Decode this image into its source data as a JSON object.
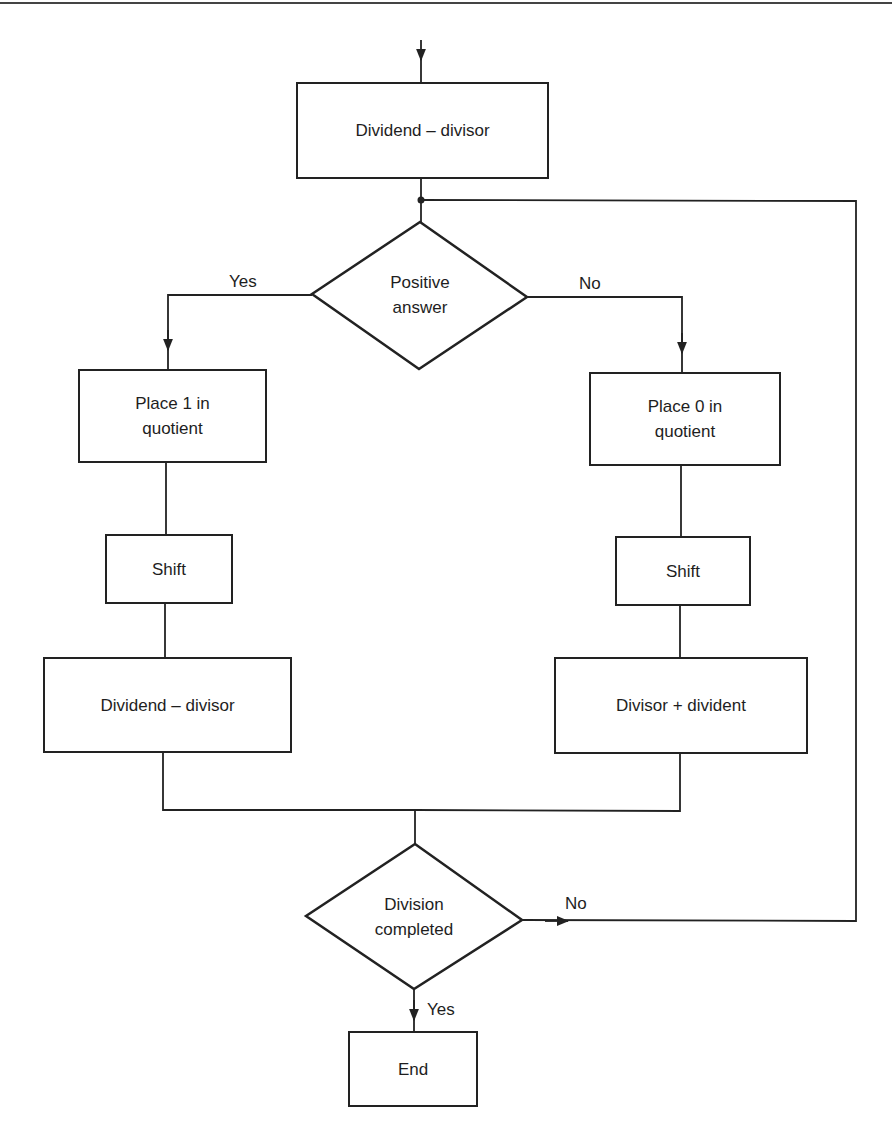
{
  "diagram": {
    "type": "flowchart",
    "nodes": {
      "start_subtract": {
        "label": "Dividend – divisor",
        "shape": "rectangle"
      },
      "decision_positive": {
        "label_line1": "Positive",
        "label_line2": "answer",
        "shape": "diamond"
      },
      "place_one": {
        "label_line1": "Place 1 in",
        "label_line2": "quotient",
        "shape": "rectangle"
      },
      "place_zero": {
        "label_line1": "Place 0 in",
        "label_line2": "quotient",
        "shape": "rectangle"
      },
      "shift_left": {
        "label": "Shift",
        "shape": "rectangle"
      },
      "shift_right": {
        "label": "Shift",
        "shape": "rectangle"
      },
      "subtract_left": {
        "label": "Dividend – divisor",
        "shape": "rectangle"
      },
      "add_right": {
        "label": "Divisor + divident",
        "shape": "rectangle"
      },
      "decision_completed": {
        "label_line1": "Division",
        "label_line2": "completed",
        "shape": "diamond"
      },
      "end": {
        "label": "End",
        "shape": "rectangle"
      }
    },
    "edge_labels": {
      "positive_yes": "Yes",
      "positive_no": "No",
      "completed_no": "No",
      "completed_yes": "Yes"
    },
    "edges": [
      {
        "from": "entry",
        "to": "start_subtract"
      },
      {
        "from": "start_subtract",
        "to": "decision_positive"
      },
      {
        "from": "decision_positive",
        "to": "place_one",
        "label": "Yes"
      },
      {
        "from": "decision_positive",
        "to": "place_zero",
        "label": "No"
      },
      {
        "from": "place_one",
        "to": "shift_left"
      },
      {
        "from": "shift_left",
        "to": "subtract_left"
      },
      {
        "from": "place_zero",
        "to": "shift_right"
      },
      {
        "from": "shift_right",
        "to": "add_right"
      },
      {
        "from": "subtract_left",
        "to": "decision_completed"
      },
      {
        "from": "add_right",
        "to": "decision_completed"
      },
      {
        "from": "decision_completed",
        "to": "decision_positive",
        "label": "No"
      },
      {
        "from": "decision_completed",
        "to": "end",
        "label": "Yes"
      }
    ],
    "colors": {
      "stroke": "#222222",
      "text": "#1e1e1e",
      "background": "#ffffff"
    }
  }
}
